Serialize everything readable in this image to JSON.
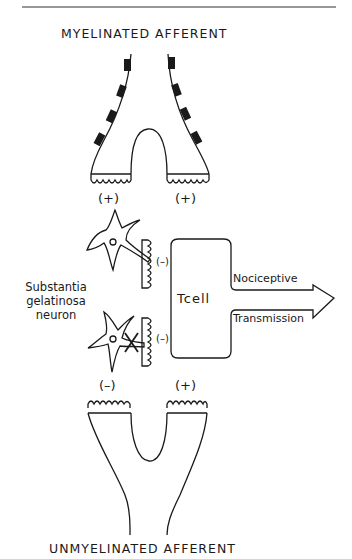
{
  "diagram": {
    "title_top": "MYELINATED AFFERENT",
    "title_bottom": "UNMYELINATED AFFERENT",
    "sg_label": [
      "Substantia",
      "gelatinosa",
      "neuron"
    ],
    "t_cell_label": "Tcell",
    "output_labels": {
      "upper": "Nociceptive",
      "lower": "Transmission"
    },
    "signs": {
      "myelinated_left": "(+)",
      "myelinated_right": "(+)",
      "sg_upper": "(–)",
      "sg_lower": "(–)",
      "unmyelinated_left": "(–)",
      "unmyelinated_right": "(+)"
    },
    "colors": {
      "line": "#1a1a1a",
      "background": "#ffffff"
    }
  }
}
